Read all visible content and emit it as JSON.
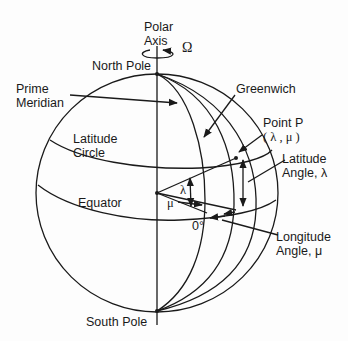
{
  "diagram": {
    "labels": {
      "polar_axis_1": "Polar",
      "polar_axis_2": "Axis",
      "omega": "Ω",
      "north_pole": "North Pole",
      "prime_meridian_1": "Prime",
      "prime_meridian_2": "Meridian",
      "greenwich": "Greenwich",
      "point_p_1": "Point P",
      "point_p_2": "( λ , μ )",
      "latitude_circle_1": "Latitude",
      "latitude_circle_2": "Circle",
      "latitude_angle_1": "Latitude",
      "latitude_angle_2": "Angle, λ",
      "equator": "Equator",
      "lambda": "λ",
      "mu": "μ",
      "zero_deg": "0°",
      "longitude_angle_1": "Longitude",
      "longitude_angle_2": "Angle, μ",
      "south_pole": "South Pole"
    },
    "colors": {
      "line": "#1a1a1a",
      "background": "#fdfdfd"
    }
  }
}
